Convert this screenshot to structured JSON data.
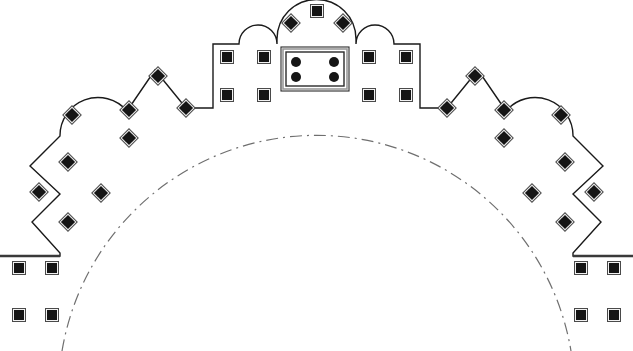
{
  "document": {
    "kind": "architectural-plan",
    "title": "Monument Plan Outline",
    "canvas": {
      "width": 633,
      "height": 351,
      "background": "#ffffff"
    }
  },
  "style": {
    "outline_color": "#1a1a1a",
    "outline_width": 1.4,
    "dashed_color": "#6f6f6f",
    "dashed_width": 1.2,
    "dash_pattern": "12 5 2 5",
    "marker_fill": "#151515",
    "marker_edge": "#4a4a4a",
    "chamber_border_color": "#2a2a2a",
    "chamber_inner_color": "#9a9a9a",
    "plinth_color": "#3a3a3a"
  },
  "labels": {
    "outline": "building-outline",
    "dashed_arc": "inner-dome-arc",
    "central_chamber": "central-chamber",
    "marker": "pillar-marker",
    "plinth_left": "left-plinth-ledge",
    "plinth_right": "right-plinth-ledge"
  },
  "geometry": {
    "outline_path": "M 0 256 L 36 256 L 60 256 L 60 253 L 32 222 L 60 194 L 30 166 L 60 136 A 38 38 0 0 1 127 111 L 155 70 L 186 108 L 213 108 L 213 44 L 239 44 A 19 19 0 0 1 277 44 L 277 39 A 39 39 0 0 1 356 39 L 356 44 A 19 19 0 0 1 394 44 L 420 44 L 420 108 L 447 108 L 478 70 L 506 111 A 38 38 0 0 1 573 136 L 603 166 L 573 194 L 601 222 L 573 253 L 573 256 L 597 256 L 633 256",
    "dashed_arc_path": "M 62 351 A 258 258 0 0 1 571 351",
    "chamber": {
      "x": 281,
      "y": 47,
      "width": 68,
      "height": 44,
      "inner_inset": 4
    },
    "plinth_left": {
      "x1": 0,
      "y1": 256,
      "x2": 60,
      "y2": 256
    },
    "plinth_right": {
      "x1": 573,
      "y1": 256,
      "x2": 633,
      "y2": 256
    },
    "markers_diamond": [
      {
        "x": 39,
        "y": 192,
        "note": "left-outer-zigzag-upper"
      },
      {
        "x": 68,
        "y": 222,
        "note": "left-outer-zigzag-mid"
      },
      {
        "x": 68,
        "y": 162,
        "note": "left-upper-face"
      },
      {
        "x": 101,
        "y": 193,
        "note": "left-inner-field"
      },
      {
        "x": 72,
        "y": 115,
        "note": "left-lobe-lower"
      },
      {
        "x": 129,
        "y": 110,
        "note": "left-lobe-upper"
      },
      {
        "x": 158,
        "y": 76,
        "note": "left-gable-apex"
      },
      {
        "x": 129,
        "y": 138,
        "note": "left-inner-lower"
      },
      {
        "x": 186,
        "y": 108,
        "note": "left-gable-foot"
      },
      {
        "x": 594,
        "y": 192,
        "note": "right-outer-zigzag-upper"
      },
      {
        "x": 565,
        "y": 222,
        "note": "right-outer-zigzag-mid"
      },
      {
        "x": 565,
        "y": 162,
        "note": "right-upper-face"
      },
      {
        "x": 532,
        "y": 193,
        "note": "right-inner-field"
      },
      {
        "x": 561,
        "y": 115,
        "note": "right-lobe-lower"
      },
      {
        "x": 504,
        "y": 110,
        "note": "right-lobe-upper"
      },
      {
        "x": 475,
        "y": 76,
        "note": "right-gable-apex"
      },
      {
        "x": 504,
        "y": 138,
        "note": "right-inner-lower"
      },
      {
        "x": 447,
        "y": 108,
        "note": "right-gable-foot"
      },
      {
        "x": 291,
        "y": 23,
        "note": "dome-left"
      },
      {
        "x": 343,
        "y": 23,
        "note": "dome-right"
      }
    ],
    "markers_square": [
      {
        "x": 227,
        "y": 57,
        "note": "central-block-left-top"
      },
      {
        "x": 227,
        "y": 95,
        "note": "central-block-left-bottom"
      },
      {
        "x": 264,
        "y": 57,
        "note": "arch-left-top"
      },
      {
        "x": 264,
        "y": 95,
        "note": "arch-left-bottom"
      },
      {
        "x": 369,
        "y": 57,
        "note": "arch-right-top"
      },
      {
        "x": 369,
        "y": 95,
        "note": "arch-right-bottom"
      },
      {
        "x": 406,
        "y": 57,
        "note": "central-block-right-top"
      },
      {
        "x": 406,
        "y": 95,
        "note": "central-block-right-bottom"
      },
      {
        "x": 317,
        "y": 11,
        "note": "dome-apex"
      },
      {
        "x": 19,
        "y": 268,
        "note": "left-plinth-outer-upper"
      },
      {
        "x": 52,
        "y": 268,
        "note": "left-plinth-inner-upper"
      },
      {
        "x": 19,
        "y": 315,
        "note": "left-plinth-outer-lower"
      },
      {
        "x": 52,
        "y": 315,
        "note": "left-plinth-inner-lower"
      },
      {
        "x": 581,
        "y": 268,
        "note": "right-plinth-inner-upper"
      },
      {
        "x": 614,
        "y": 268,
        "note": "right-plinth-outer-upper"
      },
      {
        "x": 581,
        "y": 315,
        "note": "right-plinth-inner-lower"
      },
      {
        "x": 614,
        "y": 315,
        "note": "right-plinth-outer-lower"
      }
    ],
    "markers_chamber_dot": [
      {
        "x": 296,
        "y": 62,
        "note": "chamber-nw-pillar"
      },
      {
        "x": 334,
        "y": 62,
        "note": "chamber-ne-pillar"
      },
      {
        "x": 296,
        "y": 77,
        "note": "chamber-sw-pillar"
      },
      {
        "x": 334,
        "y": 77,
        "note": "chamber-se-pillar"
      }
    ],
    "marker_size": {
      "diamond": 13,
      "square": 13,
      "dot_radius": 4.6,
      "inner_dot_radius": 3.6
    }
  }
}
